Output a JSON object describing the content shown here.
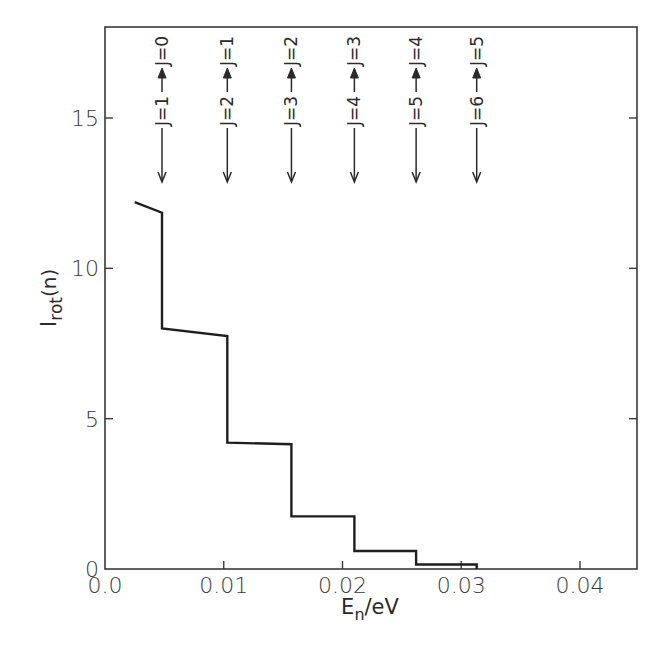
{
  "header": {
    "cropped_heading": ""
  },
  "chart_data": {
    "type": "line",
    "step": true,
    "title": "",
    "xlabel": "E_n/eV",
    "ylabel": "I_rot(n)",
    "xlim": [
      0.0,
      0.045
    ],
    "ylim": [
      0,
      18
    ],
    "grid": false,
    "legend": null,
    "x_ticks": [
      0.0,
      0.01,
      0.02,
      0.03,
      0.04
    ],
    "x_tick_labels": [
      "0.0",
      "0.01",
      "0.02",
      "0.03",
      "0.04"
    ],
    "y_ticks": [
      0,
      5,
      10,
      15
    ],
    "y_tick_labels": [
      "0",
      "5",
      "10",
      "15"
    ],
    "series": [
      {
        "name": "I_rot(n)",
        "points": [
          [
            0.0025,
            12.2
          ],
          [
            0.0048,
            11.85
          ],
          [
            0.0048,
            8.0
          ],
          [
            0.0103,
            7.75
          ],
          [
            0.0103,
            4.2
          ],
          [
            0.0157,
            4.15
          ],
          [
            0.0157,
            1.75
          ],
          [
            0.021,
            1.75
          ],
          [
            0.021,
            0.6
          ],
          [
            0.0262,
            0.6
          ],
          [
            0.0262,
            0.15
          ],
          [
            0.0313,
            0.15
          ],
          [
            0.0313,
            0.0
          ]
        ]
      }
    ],
    "annotations": [
      {
        "x": 0.0048,
        "label": "J=1 → J=0"
      },
      {
        "x": 0.0103,
        "label": "J=2 → J=1"
      },
      {
        "x": 0.0157,
        "label": "J=3 → J=2"
      },
      {
        "x": 0.021,
        "label": "J=4 → J=3"
      },
      {
        "x": 0.0262,
        "label": "J=5 → J=4"
      },
      {
        "x": 0.0313,
        "label": "J=6 → J=5"
      }
    ]
  },
  "labels": {
    "ylabel_main": "I",
    "ylabel_sub": "rot",
    "ylabel_tail": "(n)",
    "xlabel_main": "E",
    "xlabel_sub": "n",
    "xlabel_tail": "/eV",
    "ann": [
      {
        "from": "J=1",
        "to": "J=0"
      },
      {
        "from": "J=2",
        "to": "J=1"
      },
      {
        "from": "J=3",
        "to": "J=2"
      },
      {
        "from": "J=4",
        "to": "J=3"
      },
      {
        "from": "J=5",
        "to": "J=4"
      },
      {
        "from": "J=6",
        "to": "J=5"
      }
    ]
  }
}
